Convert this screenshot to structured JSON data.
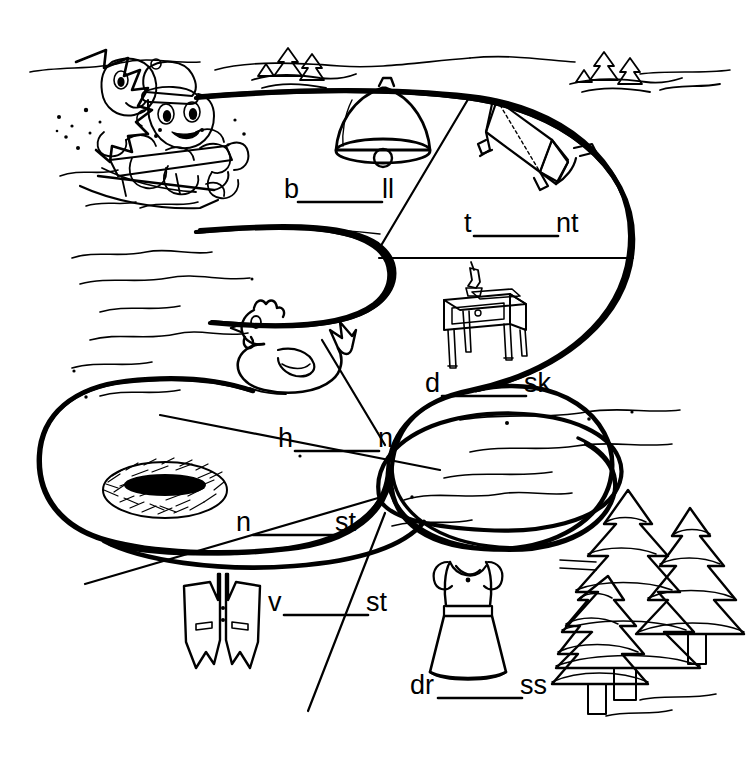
{
  "worksheet": {
    "title": "Short e Word Puzzle Worksheet",
    "background_color": "#ffffff",
    "ink_color": "#000000",
    "theme": "winter snow scene with snake-shaped word path"
  },
  "scene": {
    "illustrations": [
      {
        "name": "children-sledding",
        "label": "two children on a sled",
        "x": 60,
        "y": 45
      },
      {
        "name": "snow-drift-lines",
        "label": "snow bank contour lines",
        "x": 60,
        "y": 250
      },
      {
        "name": "small-pine-trees-top-left",
        "label": "snow covered pine trees",
        "x": 262,
        "y": 45
      },
      {
        "name": "small-pine-trees-top-right",
        "label": "snow covered pine trees",
        "x": 575,
        "y": 45
      },
      {
        "name": "large-pine-trees-right",
        "label": "three snow covered pine trees",
        "x": 555,
        "y": 470
      }
    ]
  },
  "segments": [
    {
      "id": "bell",
      "picture_name": "bell-picture",
      "picture_label": "bell",
      "prefix": "b",
      "suffix": "ll",
      "answer": "bell",
      "label_x": 284,
      "label_y": 198,
      "blank_width": 84
    },
    {
      "id": "tent",
      "picture_name": "tent-picture",
      "picture_label": "tent",
      "prefix": "t",
      "suffix": "nt",
      "answer": "tent",
      "label_x": 464,
      "label_y": 232,
      "blank_width": 84
    },
    {
      "id": "desk",
      "picture_name": "desk-picture",
      "picture_label": "desk",
      "prefix": "d",
      "suffix": "sk",
      "answer": "desk",
      "label_x": 425,
      "label_y": 392,
      "blank_width": 84
    },
    {
      "id": "hen",
      "picture_name": "hen-picture",
      "picture_label": "hen",
      "prefix": "h",
      "suffix": "n",
      "answer": "hen",
      "label_x": 278,
      "label_y": 447,
      "blank_width": 84
    },
    {
      "id": "nest",
      "picture_name": "nest-picture",
      "picture_label": "nest",
      "prefix": "n",
      "suffix": "st",
      "answer": "nest",
      "label_x": 236,
      "label_y": 531,
      "blank_width": 84
    },
    {
      "id": "vest",
      "picture_name": "vest-picture",
      "picture_label": "vest",
      "prefix": "v",
      "suffix": "st",
      "answer": "vest",
      "label_x": 268,
      "label_y": 611,
      "blank_width": 84
    },
    {
      "id": "dress",
      "picture_name": "dress-picture",
      "picture_label": "dress",
      "prefix": "dr",
      "suffix": "ss",
      "answer": "dress",
      "label_x": 410,
      "label_y": 694,
      "blank_width": 84
    }
  ]
}
